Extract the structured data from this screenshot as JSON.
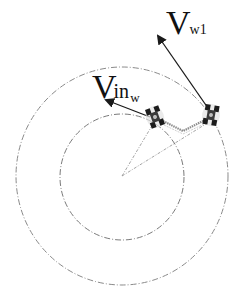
{
  "diagram": {
    "type": "two-robot circular formation velocity diagram",
    "colors": {
      "background": "#ffffff",
      "arrow": "#1a1a1a",
      "circle": "#8a8a8a",
      "radial_lines": "#9a9a9a",
      "link": "#8c8c8c",
      "robot": "#1c1c1c"
    },
    "center": {
      "x": 122,
      "y": 176
    },
    "circles": [
      {
        "name": "outer-circle",
        "rx": 106,
        "ry": 109,
        "style": "dash-dot"
      },
      {
        "name": "inner-circle",
        "rx": 62,
        "ry": 63,
        "style": "dash-dot"
      }
    ],
    "robots": [
      {
        "name": "robot-inner",
        "x": 155,
        "y": 117
      },
      {
        "name": "robot-outer",
        "x": 211,
        "y": 115
      }
    ],
    "link": {
      "points": [
        [
          163,
          121
        ],
        [
          183,
          131
        ],
        [
          205,
          120
        ]
      ]
    },
    "arrows": [
      {
        "name": "velocity-arrow-vw1",
        "from": [
          210,
          111
        ],
        "to": [
          157,
          34
        ]
      },
      {
        "name": "velocity-arrow-vinw",
        "from": [
          150,
          117
        ],
        "to": [
          104,
          99
        ]
      }
    ],
    "labels": {
      "vw1": {
        "main": "V",
        "sub": "w1"
      },
      "vinw": {
        "main": "V",
        "mid": "in",
        "sub": "w"
      }
    }
  }
}
